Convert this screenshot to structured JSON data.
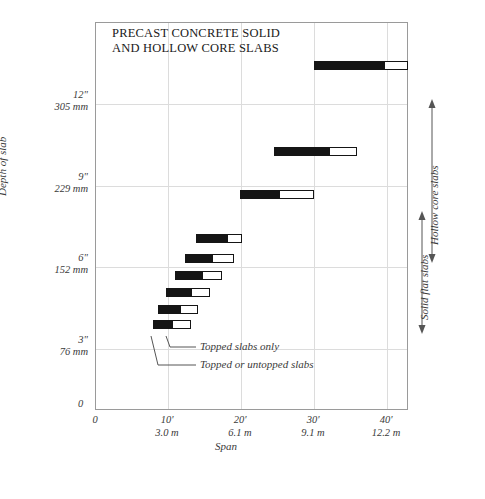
{
  "chart_data": {
    "type": "bar",
    "orientation": "horizontal",
    "title": "PRECAST CONCRETE SOLID\nAND HOLLOW CORE SLABS",
    "xlabel": "Span",
    "ylabel": "Depth of slab",
    "grid": true,
    "xlim_ft": [
      0,
      43
    ],
    "ylim_in": [
      0,
      13.5
    ],
    "x_ticks": [
      {
        "primary": "0",
        "secondary": "",
        "value_ft": 0
      },
      {
        "primary": "10'",
        "secondary": "3.0 m",
        "value_ft": 10
      },
      {
        "primary": "20'",
        "secondary": "6.1 m",
        "value_ft": 20
      },
      {
        "primary": "30'",
        "secondary": "9.1 m",
        "value_ft": 30
      },
      {
        "primary": "40'",
        "secondary": "12.2 m",
        "value_ft": 40
      }
    ],
    "y_ticks": [
      {
        "primary": "12\"",
        "secondary": "305 mm",
        "value_in": 12
      },
      {
        "primary": "9\"",
        "secondary": "229 mm",
        "value_in": 9
      },
      {
        "primary": "6\"",
        "secondary": "152 mm",
        "value_in": 6
      },
      {
        "primary": "3\"",
        "secondary": "76 mm",
        "value_in": 3
      },
      {
        "primary": "0",
        "secondary": "",
        "value_in": 0
      }
    ],
    "legend": [
      {
        "key": "topped-only",
        "label": "Topped slabs only",
        "swatch": "hollow"
      },
      {
        "key": "topped-or-untopped",
        "label": "Topped or untopped slabs",
        "swatch": "solid"
      }
    ],
    "series": [
      {
        "name": "Topped or untopped slabs",
        "color": "#151515",
        "style": "solid"
      },
      {
        "name": "Topped slabs only",
        "color": "#ffffff",
        "style": "hollow"
      }
    ],
    "bars": [
      {
        "depth_in": 12,
        "group": "Hollow core slabs",
        "solid_start_ft": 30.0,
        "solid_end_ft": 39.5,
        "hollow_end_ft": 42.8
      },
      {
        "depth_in": 9,
        "group": "Hollow core slabs",
        "solid_start_ft": 24.5,
        "solid_end_ft": 32.0,
        "hollow_end_ft": 35.8
      },
      {
        "depth_in": 7.5,
        "group": "Hollow core slabs",
        "solid_start_ft": 19.8,
        "solid_end_ft": 25.2,
        "hollow_end_ft": 30.0
      },
      {
        "depth_in": 6,
        "group": "Solid flat slabs",
        "solid_start_ft": 13.8,
        "solid_end_ft": 18.0,
        "hollow_end_ft": 20.0
      },
      {
        "depth_in": 5.3,
        "group": "Solid flat slabs",
        "solid_start_ft": 12.2,
        "solid_end_ft": 16.0,
        "hollow_end_ft": 19.0
      },
      {
        "depth_in": 4.7,
        "group": "Solid flat slabs",
        "solid_start_ft": 10.8,
        "solid_end_ft": 14.5,
        "hollow_end_ft": 17.3
      },
      {
        "depth_in": 4.1,
        "group": "Solid flat slabs",
        "solid_start_ft": 9.6,
        "solid_end_ft": 13.0,
        "hollow_end_ft": 15.7
      },
      {
        "depth_in": 3.5,
        "group": "Solid flat slabs",
        "solid_start_ft": 8.5,
        "solid_end_ft": 11.5,
        "hollow_end_ft": 14.0
      },
      {
        "depth_in": 3.0,
        "group": "Solid flat slabs",
        "solid_start_ft": 7.8,
        "solid_end_ft": 10.5,
        "hollow_end_ft": 13.0
      }
    ],
    "annotations": [
      {
        "key": "topped-only",
        "text": "Topped slabs only"
      },
      {
        "key": "topped-or-untopped",
        "text": "Topped or untopped slabs"
      }
    ],
    "range_markers": [
      {
        "key": "hollow-core",
        "label": "Hollow core slabs",
        "from_in": 7.0,
        "to_in": 12.6
      },
      {
        "key": "solid-flat",
        "label": "Solid flat slabs",
        "from_in": 2.6,
        "to_in": 6.7
      }
    ]
  }
}
